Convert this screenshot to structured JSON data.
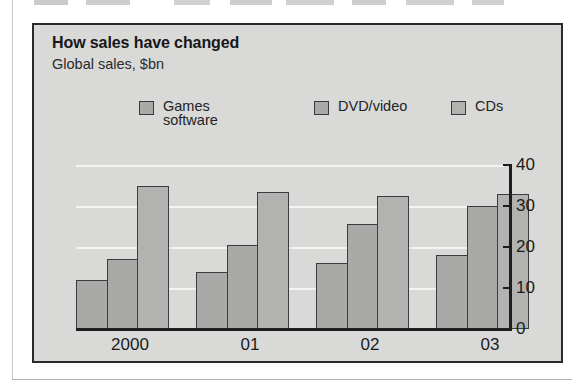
{
  "chart_panel": {
    "title": "How sales have changed",
    "subtitle": "Global sales, $bn"
  },
  "legend": [
    {
      "label": "Games\nsoftware",
      "color": "#a9a9a7"
    },
    {
      "label": "DVD/video",
      "color": "#a9a9a7"
    },
    {
      "label": "CDs",
      "color": "#b2b2b0"
    }
  ],
  "axis": {
    "y_ticks": [
      "0",
      "10",
      "20",
      "30",
      "40"
    ],
    "x_labels": [
      "2000",
      "01",
      "02",
      "03"
    ]
  },
  "chart_data": {
    "type": "bar",
    "title": "How sales have changed",
    "subtitle": "Global sales, $bn",
    "xlabel": "",
    "ylabel": "Global sales, $bn",
    "ylim": [
      0,
      40
    ],
    "yticks": [
      0,
      10,
      20,
      30,
      40
    ],
    "grid": true,
    "legend_position": "top",
    "categories": [
      "2000",
      "01",
      "02",
      "03"
    ],
    "series": [
      {
        "name": "Games software",
        "values": [
          12,
          14,
          16,
          18
        ],
        "color": "#a9a9a7"
      },
      {
        "name": "DVD/video",
        "values": [
          17,
          20.5,
          25.5,
          30
        ],
        "color": "#a9a9a7"
      },
      {
        "name": "CDs",
        "values": [
          35,
          33.5,
          32.5,
          33
        ],
        "color": "#b2b2b0"
      }
    ]
  },
  "geometry": {
    "bar_width": 32,
    "group_gap": 12,
    "group_width": 108,
    "plot_height": 164,
    "y_max": 40
  }
}
